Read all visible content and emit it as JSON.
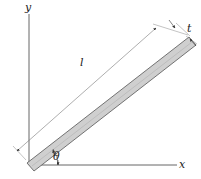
{
  "diagram": {
    "type": "inclined-bar-geometry",
    "axes": {
      "x_label": "x",
      "y_label": "y"
    },
    "bar": {
      "length_label": "l",
      "thickness_label": "t",
      "angle_label": "θ",
      "fill_color": "#cfcfcf",
      "stroke_color": "#555555"
    },
    "colors": {
      "axis": "#666666",
      "dimension": "#555555",
      "text": "#222222"
    }
  }
}
